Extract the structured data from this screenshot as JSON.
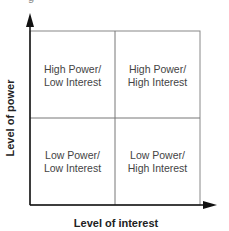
{
  "diagram": {
    "type": "2x2 matrix",
    "title_fragment": "g",
    "x_axis_label": "Level of interest",
    "y_axis_label": "Level of power",
    "quadrants": [
      {
        "position": "top-left",
        "line1": "High Power/",
        "line2": "Low Interest"
      },
      {
        "position": "top-right",
        "line1": "High Power/",
        "line2": "High Interest"
      },
      {
        "position": "bottom-left",
        "line1": "Low Power/",
        "line2": "Low Interest"
      },
      {
        "position": "bottom-right",
        "line1": "Low Power/",
        "line2": "High Interest"
      }
    ],
    "colors": {
      "axis": "#111111",
      "grid": "#777777",
      "text": "#444444"
    }
  }
}
